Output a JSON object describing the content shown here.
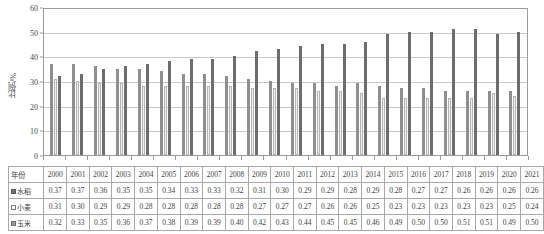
{
  "chart_data": {
    "type": "bar",
    "title": "",
    "xlabel": "",
    "ylabel": "比例/%",
    "ylim": [
      0,
      60
    ],
    "ytick_values": [
      0,
      10,
      20,
      30,
      40,
      50,
      60
    ],
    "grid": true,
    "legend_position": "table-row-labels",
    "categories": [
      "2000",
      "2001",
      "2002",
      "2003",
      "2004",
      "2005",
      "2006",
      "2007",
      "2008",
      "2009",
      "2010",
      "2011",
      "2012",
      "2013",
      "2014",
      "2015",
      "2016",
      "2017",
      "2018",
      "2019",
      "2020",
      "2021"
    ],
    "series": [
      {
        "name": "水稻",
        "color": "#8f8f8f",
        "marker": "filled-dark-square",
        "values": [
          37,
          37,
          36,
          35,
          35,
          34,
          33,
          33,
          32,
          31,
          30,
          29,
          29,
          28,
          29,
          28,
          27,
          27,
          26,
          26,
          26,
          26
        ],
        "table_values": [
          "0.37",
          "0.37",
          "0.36",
          "0.35",
          "0.35",
          "0.34",
          "0.33",
          "0.33",
          "0.32",
          "0.31",
          "0.30",
          "0.29",
          "0.29",
          "0.28",
          "0.29",
          "0.28",
          "0.27",
          "0.27",
          "0.26",
          "0.26",
          "0.26",
          "0.26"
        ]
      },
      {
        "name": "小麦",
        "color": "#efefef",
        "marker": "hollow-square",
        "values": [
          31,
          30,
          29,
          29,
          28,
          28,
          28,
          28,
          28,
          27,
          27,
          27,
          26,
          26,
          25,
          23,
          23,
          23,
          23,
          23,
          25,
          24
        ],
        "table_values": [
          "0.31",
          "0.30",
          "0.29",
          "0.29",
          "0.28",
          "0.28",
          "0.28",
          "0.28",
          "0.28",
          "0.27",
          "0.27",
          "0.27",
          "0.26",
          "0.26",
          "0.25",
          "0.23",
          "0.23",
          "0.23",
          "0.23",
          "0.23",
          "0.25",
          "0.24"
        ]
      },
      {
        "name": "玉米",
        "color": "#6d6d6d",
        "marker": "filled-gray-square",
        "values": [
          32,
          33,
          35,
          36,
          37,
          38,
          39,
          39,
          40,
          42,
          43,
          44,
          45,
          45,
          46,
          49,
          50,
          50,
          51,
          51,
          49,
          50
        ],
        "table_values": [
          "0.32",
          "0.33",
          "0.35",
          "0.36",
          "0.37",
          "0.38",
          "0.39",
          "0.39",
          "0.40",
          "0.42",
          "0.43",
          "0.44",
          "0.45",
          "0.45",
          "0.46",
          "0.49",
          "0.50",
          "0.50",
          "0.51",
          "0.51",
          "0.49",
          "0.50"
        ]
      }
    ]
  },
  "table": {
    "year_header_label": "年份",
    "row_labels": [
      "水稻",
      "小麦",
      "玉米"
    ]
  }
}
